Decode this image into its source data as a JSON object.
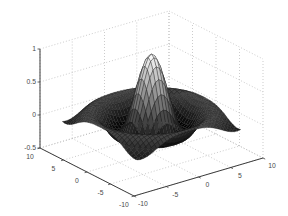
{
  "window": {
    "background_color": "#ffffff"
  },
  "chart_data": {
    "type": "surface",
    "title": "",
    "xlabel": "",
    "ylabel": "",
    "zlabel": "",
    "function": "z = sin(R)/R, R = sqrt(x^2+y^2)",
    "surface_domain": {
      "x": [
        -8,
        8
      ],
      "y": [
        -8,
        8
      ],
      "grid_step": 0.5
    },
    "axes": {
      "x": {
        "range": [
          -10,
          10
        ],
        "ticks": [
          -10,
          -5,
          0,
          5,
          10
        ],
        "tick_labels": [
          "-10",
          "-5",
          "0",
          "5",
          "10"
        ]
      },
      "y": {
        "range": [
          -10,
          10
        ],
        "ticks": [
          -10,
          -5,
          0,
          5,
          10
        ],
        "tick_labels": [
          "-10",
          "-5",
          "0",
          "5",
          "10"
        ]
      },
      "z": {
        "range": [
          -0.5,
          1
        ],
        "ticks": [
          -0.5,
          0,
          0.5,
          1
        ],
        "tick_labels": [
          "-0.5",
          "0",
          "0.5",
          "1"
        ]
      }
    },
    "z_extremes": {
      "peak": 1,
      "valley": -0.2172
    },
    "view": {
      "azimuth": -37.5,
      "elevation": 30,
      "projection": "orthographic"
    },
    "grid": "on",
    "legend": "none",
    "style": {
      "colormap": "gray",
      "plot_background": "#ffffff",
      "axis_color": "#3c3c3c",
      "grid_color": "#b6b6b6",
      "mesh_edge_color": "#1c1c1c",
      "label_color": "#4a4a4a",
      "label_font_px": 6.8
    }
  }
}
